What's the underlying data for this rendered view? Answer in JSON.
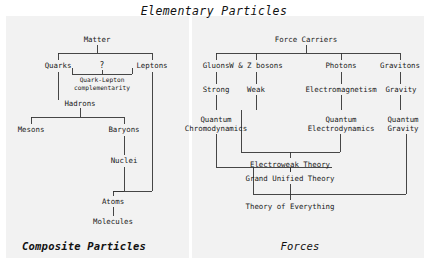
{
  "figure": {
    "title": "Elementary Particles",
    "background_color": "#ffffff",
    "panel_color": "#f2f2f2",
    "line_color": "#333333",
    "text_color": "#1a1a1a"
  },
  "left_panel": {
    "caption": "Composite Particles",
    "nodes": {
      "matter": "Matter",
      "quarks": "Quarks",
      "question": "?",
      "leptons": "Leptons",
      "complementarity_line1": "Quark-Lepton",
      "complementarity_line2": "complementarity",
      "hadrons": "Hadrons",
      "mesons": "Mesons",
      "baryons": "Baryons",
      "nuclei": "Nuclei",
      "atoms": "Atoms",
      "molecules": "Molecules"
    }
  },
  "right_panel": {
    "caption": "Forces",
    "nodes": {
      "force_carriers": "Force Carriers",
      "gluons": "Gluons",
      "wz_bosons": "W & Z bosons",
      "photons": "Photons",
      "gravitons": "Gravitons",
      "strong": "Strong",
      "weak": "Weak",
      "electromagnetism": "Electromagnetism",
      "gravity": "Gravity",
      "qcd_line1": "Quantum",
      "qcd_line2": "Chromodynamics",
      "qed_line1": "Quantum",
      "qed_line2": "Electrodynamics",
      "qg_line1": "Quantum",
      "qg_line2": "Gravity",
      "electroweak": "Electroweak Theory",
      "gut": "Grand Unified Theory",
      "toe": "Theory of Everything"
    }
  }
}
